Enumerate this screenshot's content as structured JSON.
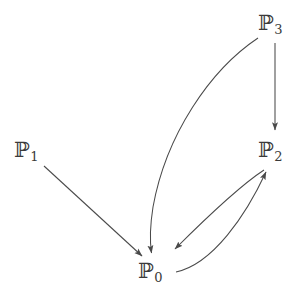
{
  "diagram": {
    "type": "directed-graph",
    "background_color": "#ffffff",
    "stroke_color": "#4a4a4a",
    "label_color": "#3a3a3a",
    "nodes": [
      {
        "id": "P0",
        "symbol": "ℙ",
        "subscript": "0",
        "label": "ℙ0",
        "x": 155,
        "y": 272
      },
      {
        "id": "P1",
        "symbol": "ℙ",
        "subscript": "1",
        "label": "ℙ1",
        "x": 31,
        "y": 151
      },
      {
        "id": "P2",
        "symbol": "ℙ",
        "subscript": "2",
        "label": "ℙ2",
        "x": 275,
        "y": 151
      },
      {
        "id": "P3",
        "symbol": "ℙ",
        "subscript": "3",
        "label": "ℙ3",
        "x": 275,
        "y": 24
      }
    ],
    "edges": [
      {
        "id": "e1",
        "from": "P1",
        "to": "P0",
        "style": "straight",
        "arrowhead": "to"
      },
      {
        "id": "e2",
        "from": "P3",
        "to": "P0",
        "style": "curved",
        "arrowhead": "to"
      },
      {
        "id": "e3",
        "from": "P3",
        "to": "P2",
        "style": "straight-vertical",
        "arrowhead": "to"
      },
      {
        "id": "e4",
        "from": "P2",
        "to": "P0",
        "style": "curved-upper",
        "arrowhead": "to"
      },
      {
        "id": "e5",
        "from": "P0",
        "to": "P2",
        "style": "curved-lower",
        "arrowhead": "to"
      }
    ]
  }
}
